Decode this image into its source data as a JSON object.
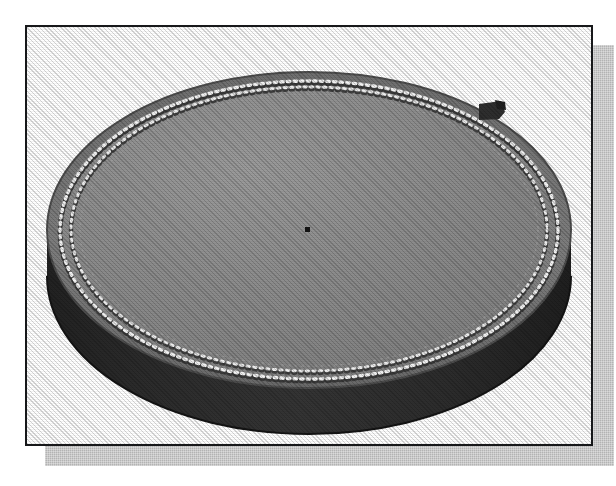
{
  "figure": {
    "caption": "",
    "view": "three-quarter isometric",
    "frame": {
      "border_color": "#17181a",
      "border_width_px": 2,
      "background_color": "#ffffff",
      "shadow_color": "#b3b3b3",
      "shadow_offset_px": 20
    },
    "object": {
      "name": "perforated round disc",
      "top_face": {
        "label": "top-face",
        "fill_color": "#8a8a8a",
        "rim_color": "#6e6e6e"
      },
      "side_wall": {
        "label": "cylinder-side-wall",
        "fill_color": "#2a2a2a",
        "highlight_color": "#3d3d3d"
      },
      "perforation_ring": {
        "label": "perforated-hole-ring",
        "hole_count": 180,
        "ring_count": 2,
        "hole_color": "#efefef",
        "hole_shadow_color": "#3a3a3a"
      },
      "center_mark": {
        "label": "center-point",
        "color": "#1a1a1a"
      },
      "edge_tab": {
        "label": "edge-tab-notch",
        "color": "#2e2e2e",
        "position": "upper-right rim"
      }
    }
  }
}
